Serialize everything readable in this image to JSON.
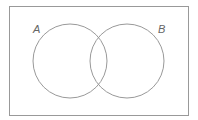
{
  "diagram": {
    "type": "venn",
    "universe": {
      "x": 9,
      "y": 6,
      "width": 179,
      "height": 109,
      "stroke": "#999999"
    },
    "sets": [
      {
        "label": "A",
        "cx": 70,
        "cy": 61,
        "r": 37,
        "label_x": 33,
        "label_y": 33
      },
      {
        "label": "B",
        "cx": 127,
        "cy": 61,
        "r": 37,
        "label_x": 158,
        "label_y": 33
      }
    ],
    "stroke_color": "#999999"
  }
}
